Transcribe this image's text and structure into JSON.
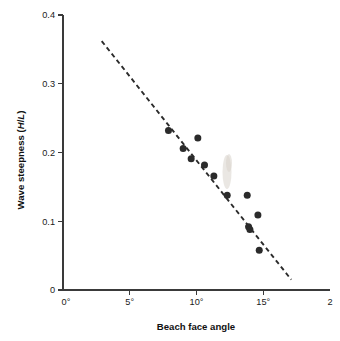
{
  "chart_data": {
    "type": "scatter",
    "title": "",
    "xlabel": "Beach face angle",
    "ylabel": "Wave steepness (H/L)",
    "ylabel_parts": {
      "prefix": "Wave steepness (",
      "italic_h": "H",
      "slash": "/",
      "italic_l": "L",
      "suffix": ")"
    },
    "xlim": [
      0,
      20
    ],
    "ylim": [
      0,
      0.4
    ],
    "xticks": [
      0,
      5,
      10,
      15,
      20
    ],
    "xticklabels": [
      "0°",
      "5°",
      "10°",
      "15°",
      "2"
    ],
    "xticklabel_full_last": "20°",
    "yticks": [
      0,
      0.1,
      0.2,
      0.3,
      0.4
    ],
    "yticklabels": [
      "0",
      "0.1",
      "0.2",
      "0.3",
      "0.4"
    ],
    "grid": false,
    "legend": "none",
    "point_color": "#2b2b2b",
    "line_color": "#2b2b2b",
    "x": [
      7.9,
      9.0,
      9.6,
      10.1,
      10.6,
      11.3,
      12.3,
      13.8,
      13.9,
      14.0,
      14.6,
      14.7
    ],
    "y": [
      0.232,
      0.206,
      0.191,
      0.221,
      0.182,
      0.166,
      0.138,
      0.138,
      0.092,
      0.088,
      0.109,
      0.058
    ],
    "points": [
      {
        "x": 7.9,
        "y": 0.232
      },
      {
        "x": 9.0,
        "y": 0.206
      },
      {
        "x": 9.6,
        "y": 0.191
      },
      {
        "x": 10.1,
        "y": 0.221
      },
      {
        "x": 10.6,
        "y": 0.182
      },
      {
        "x": 11.3,
        "y": 0.166
      },
      {
        "x": 12.3,
        "y": 0.138
      },
      {
        "x": 13.8,
        "y": 0.138
      },
      {
        "x": 13.9,
        "y": 0.092
      },
      {
        "x": 14.0,
        "y": 0.088
      },
      {
        "x": 14.6,
        "y": 0.109
      },
      {
        "x": 14.7,
        "y": 0.058
      }
    ],
    "trend_line": {
      "style": "dashed",
      "x0": 2.9,
      "y0": 0.362,
      "x1": 17.1,
      "y1": 0.015
    }
  }
}
